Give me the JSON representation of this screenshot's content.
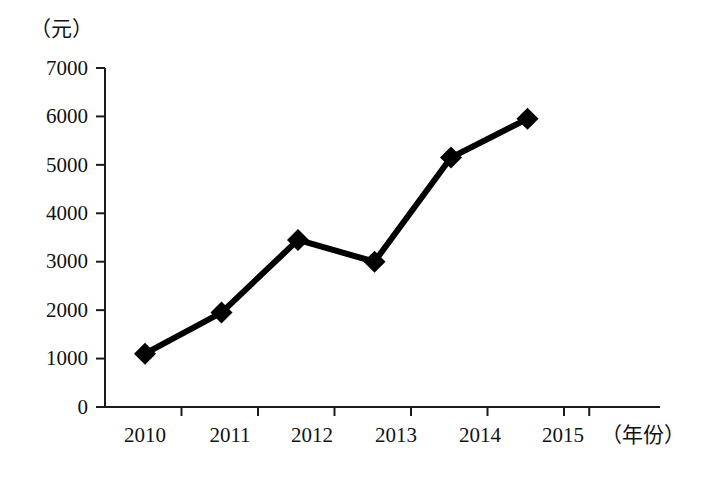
{
  "chart_data": {
    "type": "line",
    "title": "",
    "subtitle": "",
    "xlabel": "（年份）",
    "ylabel": "（元）",
    "categories": [
      "2010",
      "2011",
      "2012",
      "2013",
      "2014",
      "2015"
    ],
    "values": [
      1100,
      1950,
      3450,
      3000,
      5150,
      5950
    ],
    "series": [
      {
        "name": "",
        "values": [
          1100,
          1950,
          3450,
          3000,
          5150,
          5950
        ]
      }
    ],
    "ylim": [
      0,
      7000
    ],
    "ytick_labels": [
      "0",
      "1000",
      "2000",
      "3000",
      "4000",
      "5000",
      "6000",
      "7000"
    ],
    "ytick_values": [
      0,
      1000,
      2000,
      3000,
      4000,
      5000,
      6000,
      7000
    ],
    "xtick_labels": [
      "2010",
      "2011",
      "2012",
      "2013",
      "2014",
      "2015"
    ],
    "grid": false,
    "legend": "none",
    "marker": "diamond",
    "line_color": "#000000",
    "marker_color": "#000000",
    "axis_color": "#1a1a1a",
    "background_color": "#ffffff"
  }
}
